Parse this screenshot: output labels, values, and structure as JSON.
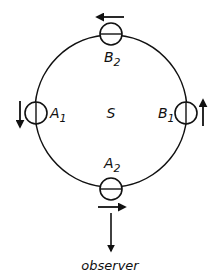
{
  "diagram": {
    "center_label": "S",
    "nodes": [
      {
        "id": "B2",
        "label": "B",
        "subscript": "2",
        "position": "top",
        "motion": "left"
      },
      {
        "id": "A1",
        "label": "A",
        "subscript": "1",
        "position": "left",
        "motion": "down"
      },
      {
        "id": "B1",
        "label": "B",
        "subscript": "1",
        "position": "right",
        "motion": "up"
      },
      {
        "id": "A2",
        "label": "A",
        "subscript": "2",
        "position": "bottom",
        "motion": "right"
      }
    ],
    "observer_label": "observer",
    "colors": {
      "stroke": "#111111",
      "background": "#ffffff"
    }
  }
}
